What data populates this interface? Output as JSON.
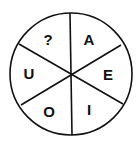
{
  "diagram": {
    "type": "segmented-circle",
    "segments": 6,
    "center": [
      71,
      74
    ],
    "radius": 61,
    "stroke_color": "#111111",
    "background": "#ffffff",
    "labels": [
      {
        "position": "top-left",
        "text": "?",
        "x": 48,
        "y": 40
      },
      {
        "position": "top-right",
        "text": "A",
        "x": 89,
        "y": 40
      },
      {
        "position": "right",
        "text": "E",
        "x": 108,
        "y": 75
      },
      {
        "position": "bottom-right",
        "text": "I",
        "x": 89,
        "y": 110
      },
      {
        "position": "bottom-left",
        "text": "O",
        "x": 49,
        "y": 112
      },
      {
        "position": "left",
        "text": "U",
        "x": 29,
        "y": 74
      }
    ]
  }
}
